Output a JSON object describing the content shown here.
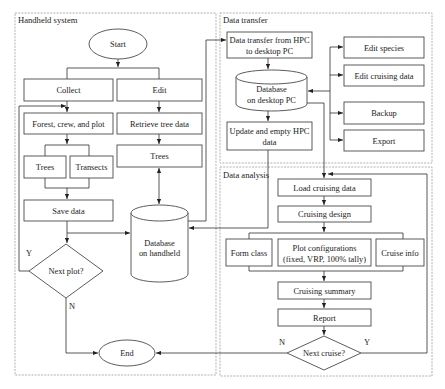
{
  "groups": {
    "handheld": "Handheld system",
    "transfer": "Data transfer",
    "analysis": "Data analysis"
  },
  "handheld": {
    "start": "Start",
    "collect": "Collect",
    "edit": "Edit",
    "forest_crew_plot": "Forest, crew, and plot",
    "retrieve_tree_data": "Retrieve tree data",
    "trees_collect": "Trees",
    "transects": "Transects",
    "trees_edit": "Trees",
    "save_data": "Save data",
    "database": [
      "Database",
      "on handheld"
    ],
    "next_plot": "Next plot?",
    "next_plot_yes": "Y",
    "next_plot_no": "N",
    "end": "End"
  },
  "transfer": {
    "transfer_from_hpc": [
      "Data transfer from HPC",
      "to desktop PC"
    ],
    "database": [
      "Database",
      "on desktop PC"
    ],
    "update_empty_hpc": [
      "Update and empty HPC",
      "data"
    ],
    "edit_species": "Edit species",
    "edit_cruising_data": "Edit cruising data",
    "backup": "Backup",
    "export": "Export"
  },
  "analysis": {
    "load_cruising_data": "Load cruising data",
    "cruising_design": "Cruising design",
    "form_class": "Form class",
    "plot_configurations": [
      "Plot configurations",
      "(fixed, VRP, 100% tally)"
    ],
    "cruise_info": "Cruise info",
    "cruising_summary": "Cruising summary",
    "report": "Report",
    "next_cruise": "Next cruise?",
    "next_cruise_no": "N",
    "next_cruise_yes": "Y"
  }
}
